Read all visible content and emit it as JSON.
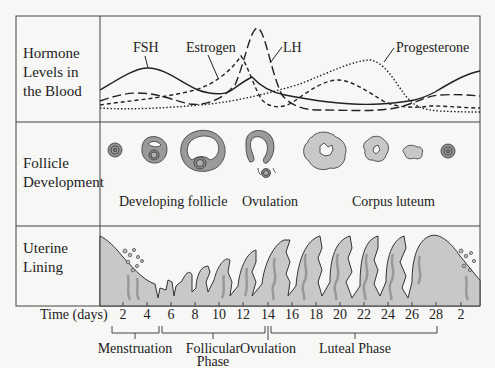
{
  "rows": {
    "hormone": {
      "label_lines": [
        "Hormone",
        "Levels in",
        "the Blood"
      ]
    },
    "follicle": {
      "label_lines": [
        "Follicle",
        "Development"
      ]
    },
    "uterine": {
      "label_lines": [
        "Uterine",
        "Lining"
      ]
    }
  },
  "hormones": {
    "fsh": {
      "label": "FSH",
      "style": "solid"
    },
    "estrogen": {
      "label": "Estrogen",
      "style": "short-dash"
    },
    "lh": {
      "label": "LH",
      "style": "long-dash"
    },
    "progesterone": {
      "label": "Progesterone",
      "style": "dotted"
    }
  },
  "follicle_labels": {
    "developing": "Developing follicle",
    "ovulation": "Ovulation",
    "corpus_luteum": "Corpus luteum"
  },
  "time_axis": {
    "label": "Time (days)",
    "ticks": [
      "2",
      "4",
      "6",
      "8",
      "10",
      "12",
      "14",
      "16",
      "18",
      "20",
      "22",
      "24",
      "26",
      "28",
      "2"
    ]
  },
  "phases": {
    "menstruation": "Menstruation",
    "follicular_line1": "Follicular",
    "follicular_line2": "Phase",
    "ovulation": "Ovulation",
    "luteal": "Luteal Phase"
  },
  "colors": {
    "line": "#222222",
    "tissue_light": "#c8c8c8",
    "tissue_dark": "#8e8e8e",
    "background": "#f7f7f5"
  }
}
